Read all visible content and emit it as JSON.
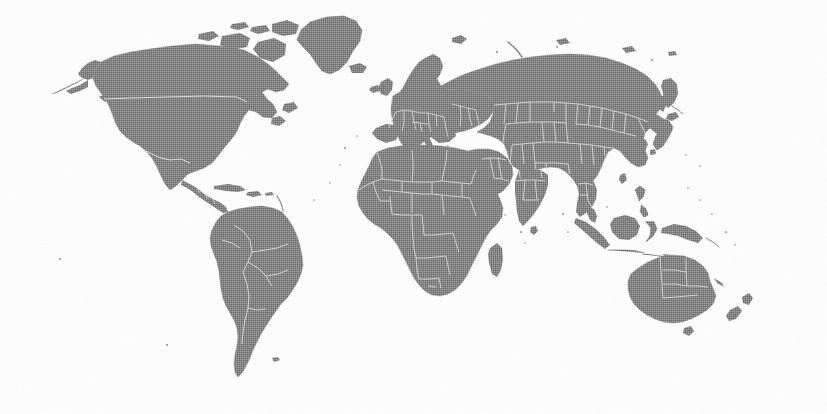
{
  "figure": {
    "kind": "world-map",
    "projection": "equirectangular",
    "width": 827,
    "height": 414,
    "has_labels": false,
    "has_legend": false,
    "has_graticule": false,
    "has_title_text": false,
    "visible_text": ""
  },
  "style": {
    "background_color": "#ffffff",
    "land_fill": "#6e6e6e",
    "land_fill_dark": "#5f5f5f",
    "border_stroke": "#d6d6d6",
    "coast_stroke": "#6e6e6e",
    "texture": "halftone-dither"
  },
  "regions": [
    {
      "name": "North America",
      "label": "North America"
    },
    {
      "name": "Greenland",
      "label": "Greenland"
    },
    {
      "name": "Central America",
      "label": "Central America"
    },
    {
      "name": "South America",
      "label": "South America"
    },
    {
      "name": "Europe",
      "label": "Europe"
    },
    {
      "name": "Africa",
      "label": "Africa"
    },
    {
      "name": "Asia",
      "label": "Asia"
    },
    {
      "name": "Southeast Asia",
      "label": "Southeast Asia"
    },
    {
      "name": "Oceania",
      "label": "Oceania"
    },
    {
      "name": "Australia",
      "label": "Australia"
    },
    {
      "name": "New Zealand",
      "label": "New Zealand"
    },
    {
      "name": "Madagascar",
      "label": "Madagascar"
    },
    {
      "name": "Japan",
      "label": "Japan"
    },
    {
      "name": "Iceland",
      "label": "Iceland"
    },
    {
      "name": "British Isles",
      "label": "British Isles"
    },
    {
      "name": "Sri Lanka",
      "label": "Sri Lanka"
    },
    {
      "name": "Caribbean",
      "label": "Caribbean"
    }
  ],
  "chart_data": {
    "type": "map",
    "title": "",
    "subtitle": "",
    "xlabel": "",
    "ylabel": "",
    "projection": "equirectangular",
    "lon_range": [
      -170,
      180
    ],
    "lat_range": [
      -58,
      83
    ],
    "series": [
      {
        "name": "landmass",
        "fill": "#6e6e6e",
        "stroke": "#d6d6d6",
        "description": "All continental landmasses shaded uniform medium gray with light country borders"
      }
    ],
    "legend": {
      "visible": false,
      "position": "none",
      "entries": []
    },
    "grid": false,
    "annotations": []
  }
}
